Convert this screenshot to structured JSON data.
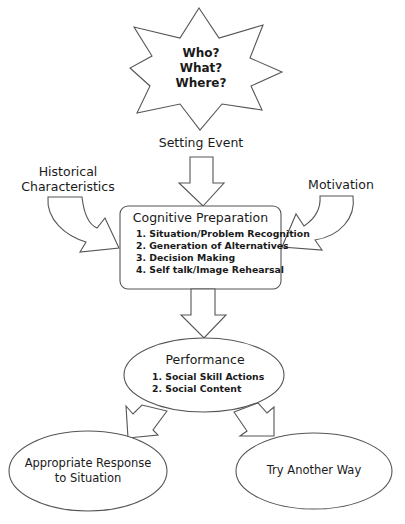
{
  "diagram": {
    "type": "flowchart",
    "star": {
      "lines": [
        "Who?",
        "What?",
        "Where?"
      ]
    },
    "setting_event": {
      "label": "Setting Event"
    },
    "historical": {
      "lines": [
        "Historical",
        "Characteristics"
      ]
    },
    "motivation": {
      "label": "Motivation"
    },
    "cognitive": {
      "title": "Cognitive Preparation",
      "items": [
        "1.  Situation/Problem Recognition",
        "2. Generation of Alternatives",
        "3. Decision Making",
        "4. Self talk/Image Rehearsal"
      ]
    },
    "performance": {
      "title": "Performance",
      "items": [
        "1.  Social Skill Actions",
        "2. Social Content"
      ]
    },
    "outcomes": {
      "left": {
        "lines": [
          "Appropriate Response",
          "to Situation"
        ]
      },
      "right": {
        "label": "Try Another Way"
      }
    },
    "colors": {
      "stroke": "#555555",
      "fill": "#ffffff",
      "text": "#1a1a1a"
    }
  }
}
